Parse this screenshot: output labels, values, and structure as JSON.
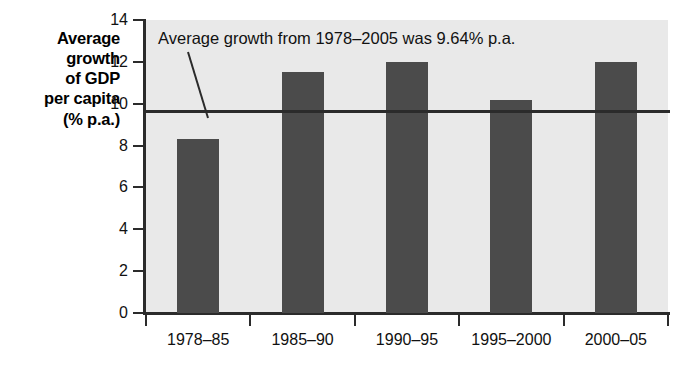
{
  "chart_data": {
    "type": "bar",
    "title": "",
    "subtitle": "",
    "xlabel": "",
    "ylabel": "Average growth of GDP per capita (% p.a.)",
    "ylabel_lines": [
      "Average",
      "growth",
      "of GDP",
      "per capita",
      "(% p.a.)"
    ],
    "categories": [
      "1978–85",
      "1985–90",
      "1990–95",
      "1995–2000",
      "2000–05"
    ],
    "values": [
      8.3,
      11.5,
      12.0,
      10.2,
      12.0
    ],
    "ylim": [
      0,
      14
    ],
    "ytick_values": [
      0,
      2,
      4,
      6,
      8,
      10,
      12,
      14
    ],
    "ytick_labels": [
      "0",
      "2",
      "4",
      "6",
      "8",
      "10",
      "12",
      "14"
    ],
    "grid": false,
    "legend": "none",
    "annotations": [
      {
        "text": "Average growth from 1978–2005 was 9.64% p.a.",
        "kind": "average-line-callout",
        "value": 9.64
      }
    ],
    "reference_line": {
      "label": "average",
      "value": 9.64
    },
    "colors": {
      "bar": "#4b4b4b",
      "plot_background": "#e9e9e9",
      "axis": "#2b2b2b",
      "page_background": "#ffffff",
      "text": "#111111"
    }
  }
}
